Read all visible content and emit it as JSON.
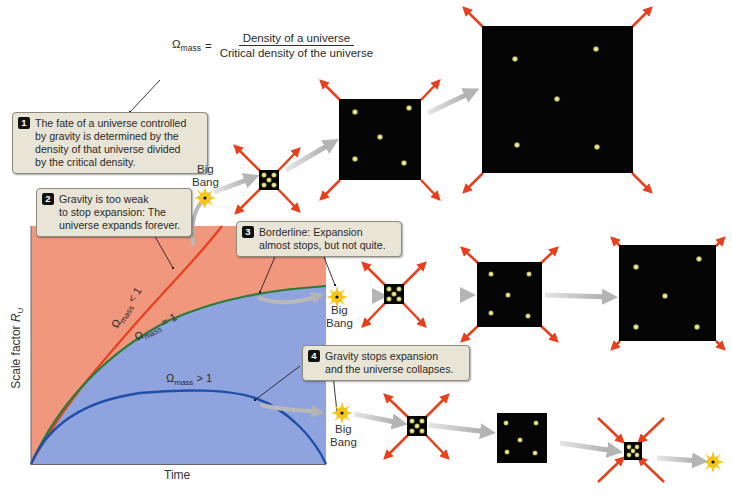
{
  "formula": {
    "lhs_symbol": "Ω",
    "lhs_subscript": "mass",
    "equals": "=",
    "numerator": "Density of a universe",
    "denominator": "Critical density of the universe"
  },
  "callouts": [
    {
      "number": "1",
      "lines": [
        "The fate of a universe controlled",
        "by gravity is determined by the",
        "density of that universe divided",
        "by the critical density."
      ]
    },
    {
      "number": "2",
      "lines": [
        "Gravity is too weak",
        "to stop expansion: The",
        "universe expands forever."
      ]
    },
    {
      "number": "3",
      "lines": [
        "Borderline: Expansion",
        "almost stops, but not quite."
      ]
    },
    {
      "number": "4",
      "lines": [
        "Gravity stops expansion",
        "and the universe collapses."
      ]
    }
  ],
  "big_bang_labels": [
    {
      "line1": "Big",
      "line2": "Bang"
    },
    {
      "line1": "Big",
      "line2": "Bang"
    },
    {
      "line1": "Big",
      "line2": "Bang"
    }
  ],
  "graph": {
    "xlabel": "Time",
    "ylabel_text": "Scale factor ",
    "ylabel_var": "R",
    "ylabel_sub": "U",
    "curves": [
      {
        "name": "open",
        "label_symbol": "Ω",
        "label_sub": "mass",
        "label_rel": " < 1",
        "color": "#e8401c"
      },
      {
        "name": "flat",
        "label_symbol": "Ω",
        "label_sub": "mass",
        "label_rel": " = 1",
        "color": "#2a7a3a"
      },
      {
        "name": "closed",
        "label_symbol": "Ω",
        "label_sub": "mass",
        "label_rel": " > 1",
        "color": "#1f4fa8"
      }
    ],
    "region_colors": {
      "upper": "#f0977e",
      "lower": "#8fa3de"
    }
  },
  "sequences": {
    "open": [
      "big-bang",
      "tiny-universe-expanding",
      "medium-universe-expanding",
      "large-universe-expanding"
    ],
    "flat": [
      "big-bang",
      "tiny-universe-expanding",
      "small-universe-expanding",
      "medium-universe-expanding"
    ],
    "closed": [
      "big-bang",
      "tiny-universe-expanding",
      "small-universe",
      "tiny-universe-collapsing",
      "big-crunch"
    ]
  },
  "colors": {
    "arrow_red": "#e8401c",
    "flow_arrow_gray": "#b0b0b0",
    "universe_black": "#050505",
    "galaxy_yellow": "#e8e890",
    "sun_yellow": "#f5c518",
    "callout_bg": "#e8e4d6"
  }
}
